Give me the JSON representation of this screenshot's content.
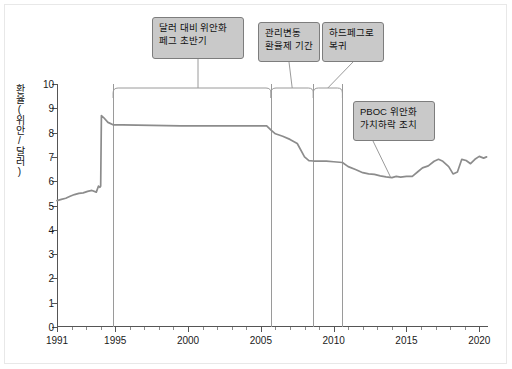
{
  "chart_data": {
    "type": "line",
    "title": "",
    "subtitle": "",
    "xlabel": "",
    "ylabel": "환율(위안/달러)",
    "xlim": [
      1991,
      2020.6
    ],
    "ylim": [
      0,
      10
    ],
    "grid": false,
    "legend": "none",
    "series_name": "USD/CNY 환율",
    "series_color": "#8c8c8c",
    "xticks_major": [
      1991,
      1995,
      2000,
      2005,
      2010,
      2015,
      2020
    ],
    "xtick_labels": [
      "1991",
      "1995",
      "2000",
      "2005",
      "2010",
      "2015",
      "2020"
    ],
    "xticks_minor": [
      1992,
      1993,
      1994,
      1996,
      1997,
      1998,
      1999,
      2001,
      2002,
      2003,
      2004,
      2006,
      2007,
      2008,
      2009,
      2011,
      2012,
      2013,
      2014,
      2016,
      2017,
      2018,
      2019,
      2020
    ],
    "yticks": [
      0,
      1,
      2,
      3,
      4,
      5,
      6,
      7,
      8,
      9,
      10
    ],
    "ytick_labels": [
      "0",
      "1",
      "2",
      "3",
      "4",
      "5",
      "6",
      "7",
      "8",
      "9",
      "10"
    ],
    "region_boundaries": [
      1994.85,
      2005.7,
      2008.6,
      2010.6
    ],
    "x": [
      1991.0,
      1991.3,
      1991.6,
      1991.9,
      1992.2,
      1992.5,
      1992.8,
      1993.1,
      1993.4,
      1993.7,
      1993.85,
      1993.95,
      1994.0,
      1994.05,
      1994.2,
      1994.5,
      1994.85,
      1995.5,
      1996.5,
      1997.5,
      1998.5,
      1999.5,
      2000.5,
      2001.5,
      2002.5,
      2003.5,
      2004.5,
      2005.4,
      2005.7,
      2006.0,
      2006.5,
      2007.0,
      2007.5,
      2008.0,
      2008.3,
      2008.6,
      2009.0,
      2009.5,
      2010.0,
      2010.6,
      2011.0,
      2011.5,
      2012.0,
      2012.4,
      2012.8,
      2013.2,
      2013.6,
      2014.0,
      2014.3,
      2014.6,
      2015.0,
      2015.4,
      2015.8,
      2016.1,
      2016.5,
      2016.9,
      2017.2,
      2017.5,
      2017.9,
      2018.2,
      2018.5,
      2018.8,
      2019.1,
      2019.4,
      2019.7,
      2020.0,
      2020.3,
      2020.5
    ],
    "y": [
      5.2,
      5.25,
      5.3,
      5.38,
      5.45,
      5.5,
      5.52,
      5.58,
      5.62,
      5.55,
      5.8,
      5.75,
      5.8,
      8.7,
      8.62,
      8.42,
      8.32,
      8.32,
      8.31,
      8.3,
      8.29,
      8.28,
      8.28,
      8.28,
      8.28,
      8.28,
      8.28,
      8.28,
      8.1,
      7.95,
      7.85,
      7.72,
      7.55,
      7.0,
      6.85,
      6.83,
      6.83,
      6.83,
      6.8,
      6.77,
      6.6,
      6.48,
      6.35,
      6.3,
      6.28,
      6.22,
      6.18,
      6.15,
      6.2,
      6.17,
      6.2,
      6.2,
      6.4,
      6.55,
      6.63,
      6.82,
      6.9,
      6.82,
      6.6,
      6.3,
      6.38,
      6.9,
      6.85,
      6.72,
      6.9,
      7.02,
      6.95,
      7.0
    ],
    "annotations": [
      {
        "id": "annotation-1",
        "text": "달러 대비 위안화\n페그 초반기",
        "region_start": 1994.85,
        "region_end": 2005.7
      },
      {
        "id": "annotation-2",
        "text": "관리변동\n환율제 기간",
        "region_start": 2005.7,
        "region_end": 2008.6
      },
      {
        "id": "annotation-3",
        "text": "하드페그로\n복귀",
        "region_start": 2008.6,
        "region_end": 2010.6
      },
      {
        "id": "annotation-4",
        "text": "PBOC 위안화\n가치하락 조치",
        "point_x": 2013.9,
        "point_y": 6.18
      }
    ]
  },
  "colors": {
    "line": "#8c8c8c",
    "axis": "#555555",
    "callout_fill": "#c9c9c9",
    "callout_border": "#7d7d7d",
    "frame": "#e8e8e8",
    "region_divider": "#9a9a9a"
  }
}
